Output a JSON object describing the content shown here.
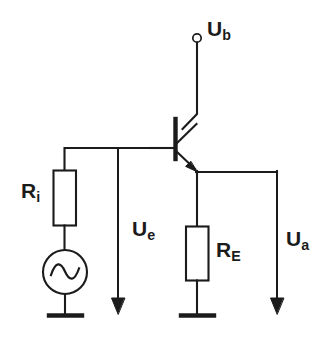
{
  "diagram": {
    "background_color": "#ffffff",
    "line_color": "#1b1b1b"
  },
  "labels": {
    "supply": {
      "symbol": "U",
      "subscript": "b",
      "full": "Ub"
    },
    "input_resistor": {
      "symbol": "R",
      "subscript": "i",
      "full": "Ri"
    },
    "input_voltage": {
      "symbol": "U",
      "subscript": "e",
      "full": "Ue"
    },
    "emitter_resistor": {
      "symbol": "R",
      "subscript": "E",
      "full": "RE"
    },
    "output_voltage": {
      "symbol": "U",
      "subscript": "a",
      "full": "Ua"
    }
  },
  "components": {
    "supply_terminal": {
      "name": "open-circle-terminal",
      "x": 197,
      "y": 38,
      "radius": 4
    },
    "transistor": {
      "name": "npn-bipolar-transistor",
      "type": "NPN",
      "base_x": 175,
      "base_top_y": 120,
      "base_bottom_y": 158
    },
    "resistor_ri": {
      "name": "resistor",
      "x": 53,
      "y": 170,
      "width": 23,
      "height": 56
    },
    "resistor_re": {
      "name": "resistor",
      "x": 186,
      "y": 226,
      "width": 23,
      "height": 55
    },
    "ac_source": {
      "name": "ac-voltage-source",
      "cx": 65,
      "cy": 272,
      "radius": 22,
      "waveform": "sine"
    },
    "ground_left": {
      "name": "ground-symbol",
      "x": 50,
      "y": 315,
      "width": 32
    },
    "ground_right": {
      "name": "ground-symbol",
      "x": 181,
      "y": 315,
      "width": 32
    },
    "arrow_ue": {
      "name": "voltage-arrow",
      "x": 118,
      "y_start": 152,
      "y_end": 313,
      "direction": "down"
    },
    "arrow_ua": {
      "name": "voltage-arrow",
      "x": 277,
      "y_start": 172,
      "y_end": 313,
      "direction": "down"
    }
  }
}
